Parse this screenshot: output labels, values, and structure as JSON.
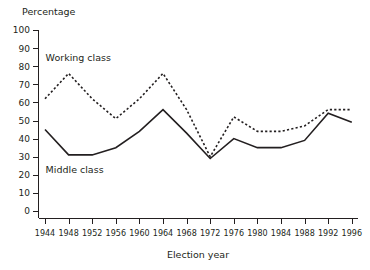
{
  "chart_data": {
    "type": "line",
    "title": "",
    "ylabel": "Percentage",
    "xlabel": "Election year",
    "grid": false,
    "legend_position": "inline-annotation",
    "ylim": [
      0,
      100
    ],
    "ytick_step": 10,
    "yticks": [
      "0",
      "10",
      "20",
      "30",
      "40",
      "50",
      "60",
      "70",
      "80",
      "90",
      "100"
    ],
    "categories": [
      "1944",
      "1948",
      "1952",
      "1956",
      "1960",
      "1964",
      "1968",
      "1972",
      "1976",
      "1980",
      "1984",
      "1988",
      "1992",
      "1996"
    ],
    "series": [
      {
        "name": "Working class",
        "style": "dashed",
        "values": [
          62,
          76,
          62,
          51,
          62,
          76,
          56,
          30,
          52,
          44,
          44,
          47,
          56,
          56
        ]
      },
      {
        "name": "Middle class",
        "style": "solid",
        "values": [
          45,
          31,
          31,
          35,
          44,
          56,
          43,
          29,
          40,
          35,
          35,
          39,
          54,
          49
        ]
      }
    ],
    "annotations": [
      {
        "text": "Working class",
        "x_value": "1948",
        "y_value": 83
      },
      {
        "text": "Middle class",
        "x_value": "1948",
        "y_value": 21
      }
    ]
  }
}
